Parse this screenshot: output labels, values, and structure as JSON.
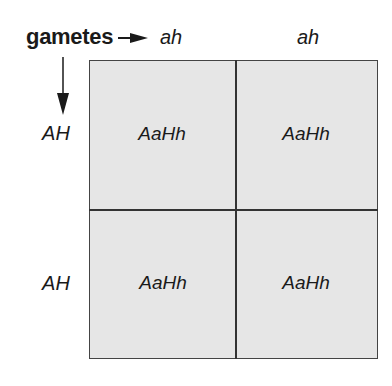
{
  "diagram": {
    "type": "punnett-square",
    "axis_label": "gametes",
    "column_gametes": [
      "ah",
      "ah"
    ],
    "row_gametes": [
      "AH",
      "AH"
    ],
    "cells": [
      [
        "AaHh",
        "AaHh"
      ],
      [
        "AaHh",
        "AaHh"
      ]
    ],
    "colors": {
      "cell_fill": "#e6e6e6",
      "border": "#333333"
    }
  }
}
